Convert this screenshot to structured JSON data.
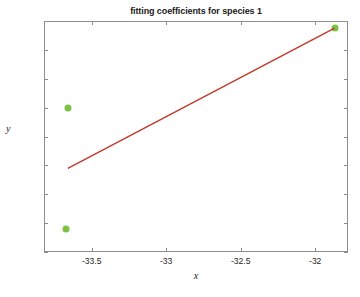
{
  "chart_data": {
    "type": "scatter",
    "title": "fitting coefficients for species 1",
    "xlabel": "x",
    "ylabel": "y",
    "xlim": [
      -33.82,
      -31.78
    ],
    "ylim": [
      -0.1,
      0.06
    ],
    "grid": false,
    "legend": null,
    "xticks": [
      -33.5,
      -33,
      -32.5,
      -32
    ],
    "xtick_labels": [
      "-33.5",
      "-33",
      "-32.5",
      "-32"
    ],
    "yticks": [
      0.06,
      0.04,
      0.02,
      0,
      -0.02,
      -0.04,
      -0.06,
      -0.08,
      -0.1
    ],
    "ytick_labels": [
      "0.06",
      "0.04",
      "0.02",
      "0",
      "-0.02",
      "-0.04",
      "-0.06",
      "-0.08",
      "-0.1"
    ],
    "series": [
      {
        "name": "data points",
        "type": "scatter",
        "color": "#7dc242",
        "marker": "filled-circle",
        "points": [
          {
            "x": -33.66,
            "y": 0.0
          },
          {
            "x": -33.67,
            "y": -0.084
          },
          {
            "x": -31.87,
            "y": 0.055
          }
        ]
      },
      {
        "name": "fit line",
        "type": "line",
        "color": "#c0392b",
        "points": [
          {
            "x": -33.66,
            "y": -0.042
          },
          {
            "x": -31.87,
            "y": 0.055
          }
        ]
      }
    ]
  },
  "figure": {
    "background_color": "#ffffff",
    "axes_color": "#8d8d8d",
    "text_color": "#262626"
  }
}
